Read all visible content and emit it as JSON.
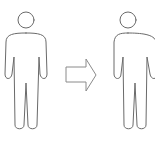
{
  "diagram": {
    "figures": [
      {
        "id": "before",
        "icon": "person-outline-icon",
        "position": "left"
      },
      {
        "id": "after",
        "icon": "person-outline-icon",
        "position": "right",
        "note": "slightly broader torso, clipped at right edge"
      }
    ],
    "connector": {
      "icon": "arrow-right-icon",
      "direction": "right"
    },
    "colors": {
      "stroke": "#6a6a6a",
      "arrow_stroke": "#8a8a8a",
      "background": "#ffffff"
    }
  }
}
